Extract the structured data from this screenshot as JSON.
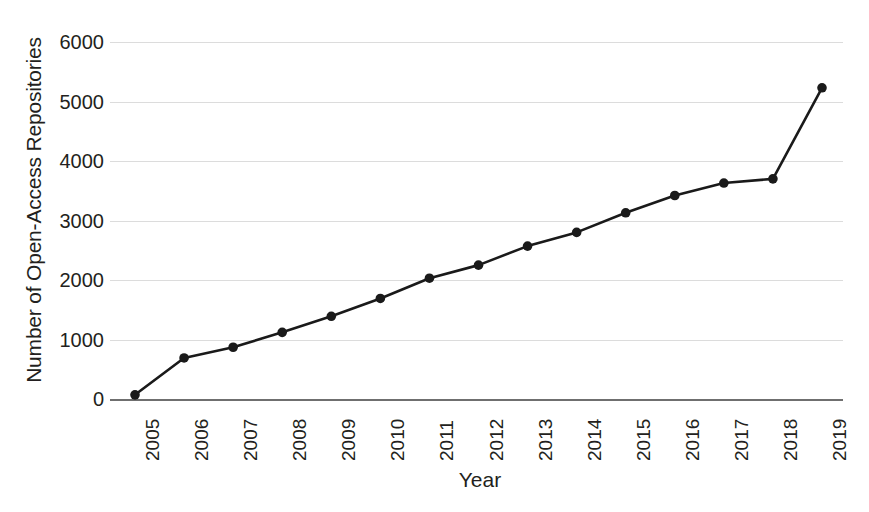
{
  "chart_data": {
    "type": "line",
    "title": "",
    "xlabel": "Year",
    "ylabel": "Number of Open-Access Repositories",
    "categories": [
      "2005",
      "2006",
      "2007",
      "2008",
      "2009",
      "2010",
      "2011",
      "2012",
      "2013",
      "2014",
      "2015",
      "2016",
      "2017",
      "2018",
      "2019"
    ],
    "values": [
      70,
      690,
      870,
      1120,
      1390,
      1690,
      2030,
      2250,
      2570,
      2800,
      3130,
      3420,
      3630,
      3700,
      5230
    ],
    "series": [
      {
        "name": "Open-Access Repositories",
        "values": [
          70,
          690,
          870,
          1120,
          1390,
          1690,
          2030,
          2250,
          2570,
          2800,
          3130,
          3420,
          3630,
          3700,
          5230
        ]
      }
    ],
    "x": [
      2005,
      2006,
      2007,
      2008,
      2009,
      2010,
      2011,
      2012,
      2013,
      2014,
      2015,
      2016,
      2017,
      2018,
      2019
    ],
    "ylim": [
      0,
      6000
    ],
    "xlim": [
      2005,
      2019
    ],
    "yticks": [
      0,
      1000,
      2000,
      3000,
      4000,
      5000,
      6000
    ],
    "ytick_labels": [
      "0",
      "1000",
      "2000",
      "3000",
      "4000",
      "5000",
      "6000"
    ],
    "xtick_labels": [
      "2005",
      "2006",
      "2007",
      "2008",
      "2009",
      "2010",
      "2011",
      "2012",
      "2013",
      "2014",
      "2015",
      "2016",
      "2017",
      "2018",
      "2019"
    ],
    "xtick_rotation": 90,
    "grid": "horizontal",
    "legend": "none",
    "marker": "circle",
    "line_color": "#1a1a1a",
    "marker_color": "#1a1a1a",
    "grid_color": "#dcdcdc",
    "axis_color": "#6f6f6f",
    "background_color": "#ffffff",
    "text_color": "#231f20"
  }
}
